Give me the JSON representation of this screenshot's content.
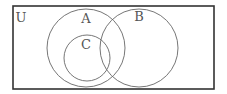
{
  "diagram": {
    "type": "venn",
    "universe": {
      "label": "U",
      "rect": {
        "x": 13,
        "y": 6,
        "width": 201,
        "height": 83
      },
      "label_pos": {
        "x": 21,
        "y": 22
      }
    },
    "sets": [
      {
        "id": "A",
        "label": "A",
        "cx": 86,
        "cy": 48,
        "r": 39,
        "label_pos": {
          "x": 86,
          "y": 22
        }
      },
      {
        "id": "B",
        "label": "B",
        "cx": 139,
        "cy": 48,
        "r": 39,
        "label_pos": {
          "x": 139,
          "y": 20
        }
      },
      {
        "id": "C",
        "label": "C",
        "cx": 87,
        "cy": 58,
        "r": 23,
        "label_pos": {
          "x": 86,
          "y": 48
        }
      }
    ],
    "relationships": [
      "C is a subset of A",
      "A and B overlap",
      "C and B overlap"
    ],
    "colors": {
      "border": "#333333",
      "circle": "#666666",
      "text": "#555555",
      "background": "#ffffff"
    }
  }
}
